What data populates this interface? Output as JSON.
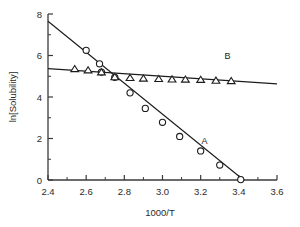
{
  "chart_data": {
    "type": "scatter",
    "title": "",
    "xlabel": "1000/T",
    "ylabel": "ln[Solubility]",
    "xlim": [
      2.4,
      3.6
    ],
    "ylim": [
      0,
      8
    ],
    "grid": false,
    "legend_position": "inline-annotations",
    "xticks": [
      2.4,
      2.6,
      2.8,
      3.0,
      3.2,
      3.4,
      3.6
    ],
    "xticklabels": [
      "2.4",
      "2.6",
      "2.8",
      "3.0",
      "3.2",
      "3.4",
      "3.6"
    ],
    "xminorticks": [
      2.5,
      2.7,
      2.9,
      3.1,
      3.3,
      3.5
    ],
    "yticks": [
      0,
      2,
      4,
      6,
      8
    ],
    "yticklabels": [
      "0",
      "2",
      "4",
      "6",
      "8"
    ],
    "yminorticks": [
      1,
      3,
      5,
      7
    ],
    "series": [
      {
        "name": "A",
        "label": "A",
        "label_x": 3.22,
        "label_y": 1.72,
        "marker": "circle",
        "x": [
          2.6,
          2.67,
          2.68,
          2.75,
          2.83,
          2.91,
          3.0,
          3.09,
          3.2,
          3.3,
          3.41
        ],
        "y": [
          6.25,
          5.6,
          5.2,
          4.95,
          4.2,
          3.45,
          2.78,
          2.1,
          1.4,
          0.72,
          0.02
        ],
        "fit": {
          "x0": 2.4,
          "y0": 7.65,
          "x1": 3.425,
          "y1": 0.0
        }
      },
      {
        "name": "B",
        "label": "B",
        "label_x": 3.34,
        "label_y": 5.85,
        "marker": "triangle",
        "x": [
          2.54,
          2.61,
          2.68,
          2.75,
          2.83,
          2.9,
          2.98,
          3.05,
          3.12,
          3.2,
          3.28,
          3.36
        ],
        "y": [
          5.36,
          5.3,
          5.2,
          4.97,
          4.93,
          4.9,
          4.88,
          4.86,
          4.85,
          4.84,
          4.8,
          4.78
        ],
        "fit": {
          "x0": 2.4,
          "y0": 5.37,
          "x1": 3.6,
          "y1": 4.63
        }
      }
    ]
  },
  "figure": {
    "xlabel_text": "1000/T",
    "ylabel_text": "ln[Solubility]",
    "series_a_label": "A",
    "series_b_label": "B"
  },
  "colors": {
    "marker_stroke": "#1c1c1c",
    "marker_fill": "#ffffff",
    "line": "#1c1c1c",
    "axis": "#3a3a3a",
    "text": "#2b2b2b",
    "background": "#ffffff"
  }
}
